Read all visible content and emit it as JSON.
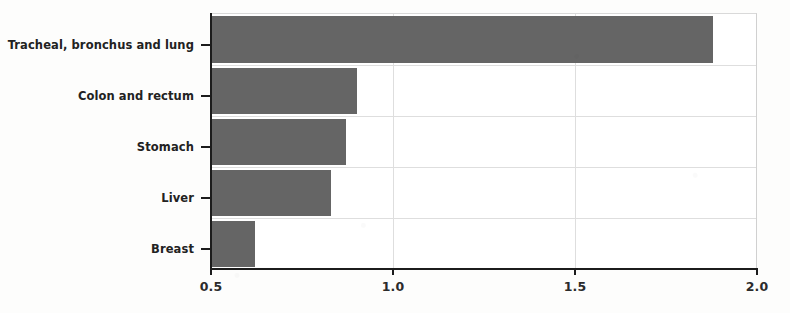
{
  "chart_data": {
    "type": "bar",
    "orientation": "horizontal",
    "title": "",
    "subtitle": "",
    "xlabel": "",
    "ylabel": "",
    "categories": [
      "Tracheal, bronchus and lung",
      "Colon and rectum",
      "Stomach",
      "Liver",
      "Breast"
    ],
    "values": [
      1.88,
      0.9,
      0.87,
      0.83,
      0.62
    ],
    "xlim": [
      0.5,
      2.0
    ],
    "xticks": [
      0.5,
      1.0,
      1.5,
      2.0
    ],
    "xtick_labels": [
      "0.5",
      "1.0",
      "1.5",
      "2.0"
    ],
    "grid": true,
    "legend": false,
    "bar_color": "#656565",
    "axis_color": "#1c1c1c",
    "grid_color": "#dedede",
    "background_color": "#ffffff"
  },
  "axis": {
    "x_labels": [
      {
        "text": "0.5",
        "value": 0.5
      },
      {
        "text": "1.0",
        "value": 1.0
      },
      {
        "text": "1.5",
        "value": 1.5
      },
      {
        "text": "2.0",
        "value": 2.0
      }
    ],
    "y_labels": [
      {
        "text": "Tracheal, bronchus and lung"
      },
      {
        "text": "Colon and rectum"
      },
      {
        "text": "Stomach"
      },
      {
        "text": "Liver"
      },
      {
        "text": "Breast"
      }
    ]
  }
}
